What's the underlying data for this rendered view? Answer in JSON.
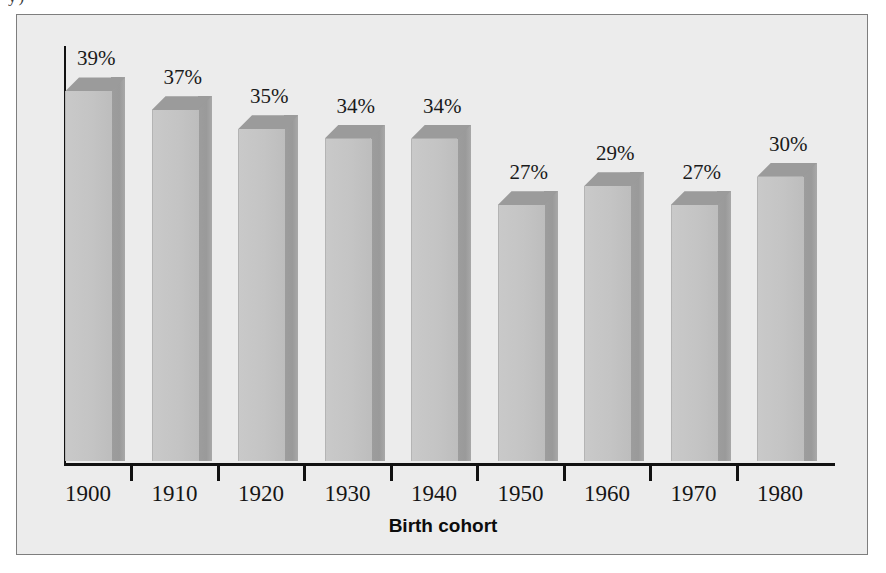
{
  "figure": {
    "background_color": "#ececec",
    "border_color": "#7e7e7e",
    "crop_artifact_text": "y)"
  },
  "axis": {
    "title": "Birth cohort",
    "line_color": "#111111"
  },
  "chart_data": {
    "type": "bar",
    "title": "",
    "subtitle": "",
    "xlabel": "Birth cohort",
    "ylabel": "",
    "categories": [
      "1900",
      "1910",
      "1920",
      "1930",
      "1940",
      "1950",
      "1960",
      "1970",
      "1980"
    ],
    "values": [
      39,
      37,
      35,
      34,
      34,
      27,
      29,
      27,
      30
    ],
    "data_labels": [
      "39%",
      "37%",
      "35%",
      "34%",
      "34%",
      "27%",
      "29%",
      "27%",
      "30%"
    ],
    "unit": "%",
    "ylim": [
      0,
      44
    ],
    "grid": false,
    "legend": null,
    "legend_position": "none",
    "bar_style": "3d-extruded",
    "bar_front_color": "#c4c4c4",
    "bar_side_color": "#9d9d9d",
    "bar_top_color": "#9b9b9b",
    "label_color": "#1a1a1a",
    "annotations": []
  }
}
